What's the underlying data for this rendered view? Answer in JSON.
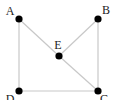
{
  "diagram": {
    "type": "graph",
    "nodes": [
      {
        "id": "A",
        "label": "A"
      },
      {
        "id": "B",
        "label": "B"
      },
      {
        "id": "C",
        "label": "C"
      },
      {
        "id": "D",
        "label": "D"
      },
      {
        "id": "E",
        "label": "E"
      }
    ],
    "edges": [
      {
        "from": "A",
        "to": "D"
      },
      {
        "from": "A",
        "to": "E"
      },
      {
        "from": "E",
        "to": "C"
      },
      {
        "from": "B",
        "to": "E"
      },
      {
        "from": "B",
        "to": "C"
      },
      {
        "from": "D",
        "to": "C"
      }
    ],
    "colors": {
      "edge": "#c8c8c8",
      "node": "#000000",
      "label": "#222222"
    }
  }
}
